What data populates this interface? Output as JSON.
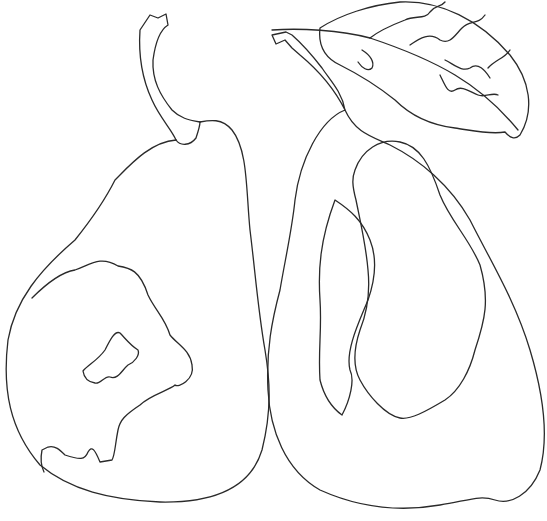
{
  "image": {
    "subject": "Line drawing of two pears",
    "width": 547,
    "height": 521,
    "background": "#ffffff",
    "stroke": "#2a2a2a",
    "elements": [
      {
        "name": "left-pear",
        "features": [
          "stem",
          "russet patch",
          "inner spot"
        ]
      },
      {
        "name": "right-pear",
        "features": [
          "stem",
          "leaf",
          "inner highlight contour"
        ]
      }
    ]
  }
}
